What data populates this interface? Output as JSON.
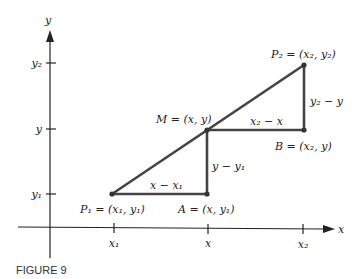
{
  "figure": {
    "caption": "FIGURE 9",
    "axes": {
      "x_label": "x",
      "y_label": "y"
    },
    "x_ticks": [
      "x₁",
      "x",
      "x₂"
    ],
    "y_ticks": [
      "y₂",
      "y",
      "y₁"
    ],
    "points": {
      "P1": "P₁ = (x₁, y₁)",
      "A": "A = (x, y₁)",
      "M": "M = (x, y)",
      "B": "B = (x₂, y)",
      "P2": "P₂ = (x₂, y₂)"
    },
    "segment_labels": {
      "P1_A": "x − x₁",
      "A_M": "y − y₁",
      "M_B": "x₂ − x",
      "B_P2": "y₂ − y"
    },
    "colors": {
      "axis": "#222222",
      "segments": "#444444"
    }
  }
}
